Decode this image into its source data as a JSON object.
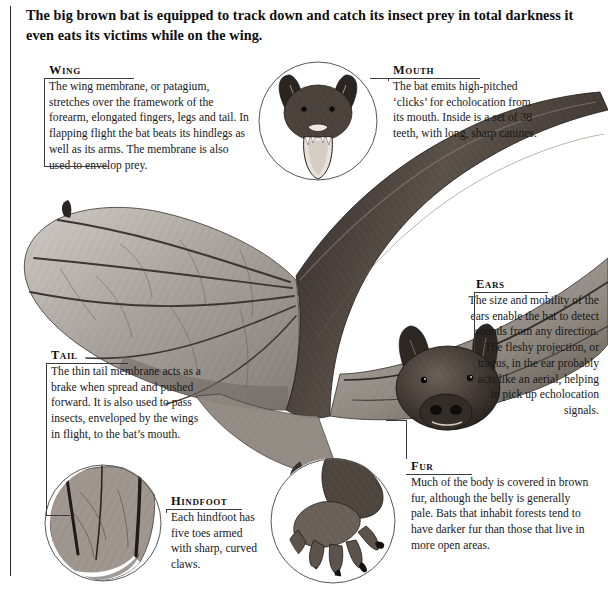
{
  "headline": "The big brown bat is equipped to track down and catch its insect prey in total darkness it even eats its victims while on the wing.",
  "callouts": {
    "wing": {
      "title": "Wing",
      "body": "The wing membrane, or patagium, stretches over the framework of the forearm, elongated fingers, legs and tail. In flapping flight the bat beats its hindlegs as well as its arms. The membrane is also used to envelop prey."
    },
    "mouth": {
      "title": "Mouth",
      "body": "The bat emits high-pitched ‘clicks’ for echolocation from its mouth. Inside is a set of 38 teeth, with long, sharp canines."
    },
    "ears": {
      "title": "Ears",
      "body": "The size and mobility of the ears enable the bat to detect sounds from any direction. The fleshy projection, or tragus, in the ear probably acts like an aerial, helping to pick up echolocation signals."
    },
    "tail": {
      "title": "Tail",
      "body": "The thin tail membrane acts as a brake when spread and pushed forward. It is also used to pass insects, enveloped by the wings in flight, to the bat’s mouth."
    },
    "hindfoot": {
      "title": "Hindfoot",
      "body": "Each hindfoot has five toes armed with sharp, curved claws."
    },
    "fur": {
      "title": "Fur",
      "body": "Much of the body is covered in brown fur, although the belly is generally pale. Bats that inhabit forests tend to have darker fur than those that live in more open areas."
    }
  },
  "figures": {
    "main_bat": "big-brown-bat-in-flight-illustration",
    "mouth_inset": "bat-head-open-mouth-detail",
    "tail_inset": "tail-membrane-uropatagium-detail",
    "hindfoot_inset": "hindfoot-with-claws-detail"
  },
  "colors": {
    "ink": "#1a1a1a",
    "rule": "#3a3a3a",
    "paper": "#ffffff",
    "fur_dark": "#3b3430",
    "fur_mid": "#6e645c",
    "membrane": "#9a948e"
  }
}
